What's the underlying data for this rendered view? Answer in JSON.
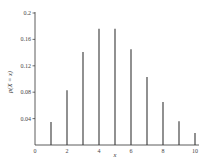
{
  "chart_data": {
    "type": "bar",
    "subtype": "stem",
    "title": "",
    "xlabel": "x",
    "ylabel": "p(X = x)",
    "x": [
      1,
      2,
      3,
      4,
      5,
      6,
      7,
      8,
      9,
      10
    ],
    "values": [
      0.035,
      0.083,
      0.141,
      0.176,
      0.176,
      0.145,
      0.103,
      0.065,
      0.036,
      0.018
    ],
    "xticks": [
      0,
      2,
      4,
      6,
      8,
      10
    ],
    "xtick_labels": [
      "0",
      "2",
      "4",
      "6",
      "8",
      "10"
    ],
    "yticks": [
      0.04,
      0.08,
      0.12,
      0.16,
      0.2
    ],
    "ytick_labels": [
      "0.04",
      "0.08",
      "0.12",
      "0.16",
      "0.2"
    ],
    "xlim": [
      0,
      10.2
    ],
    "ylim": [
      0,
      0.2
    ],
    "grid": false,
    "legend": null,
    "colors": {
      "bar": "#555555",
      "axis": "#333333"
    }
  },
  "labels": {
    "xlabel": "x",
    "ylabel": "p(X = x)"
  }
}
